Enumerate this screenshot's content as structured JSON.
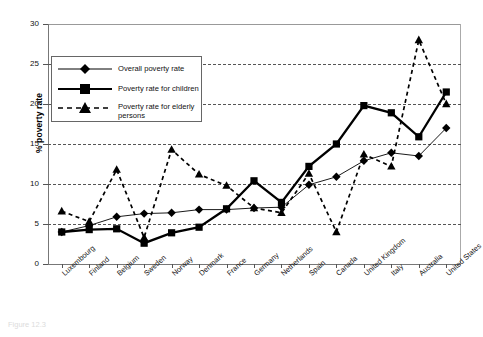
{
  "chart_data": {
    "type": "line",
    "title": "",
    "xlabel": "",
    "ylabel": "% poverty rate",
    "ylim": [
      0,
      30
    ],
    "yticks": [
      0,
      5,
      10,
      15,
      20,
      25,
      30
    ],
    "grid": true,
    "legend_position": "upper-left-inside",
    "categories": [
      "Luxembourg",
      "Finland",
      "Belgium",
      "Sweden",
      "Norway",
      "Denmark",
      "France",
      "Germany",
      "Netherlands",
      "Spain",
      "Canada",
      "United Kingdom",
      "Italy",
      "Australia",
      "United States"
    ],
    "series": [
      {
        "name": "Overall poverty rate",
        "marker": "diamond",
        "line": "solid",
        "values": [
          4.0,
          4.8,
          5.9,
          6.3,
          6.4,
          6.8,
          6.8,
          7.0,
          7.1,
          9.9,
          10.9,
          12.9,
          13.9,
          13.5,
          17.0
        ]
      },
      {
        "name": "Poverty rate for children",
        "marker": "square",
        "line": "solid-thick",
        "values": [
          4.0,
          4.3,
          4.4,
          2.6,
          3.9,
          4.6,
          6.9,
          10.4,
          7.7,
          12.2,
          15.0,
          19.8,
          18.9,
          15.9,
          21.5
        ]
      },
      {
        "name": "Poverty rate for elderly persons",
        "marker": "triangle",
        "line": "dashed",
        "values": [
          6.6,
          5.3,
          11.8,
          3.3,
          14.3,
          11.2,
          9.8,
          7.0,
          6.4,
          11.3,
          4.0,
          13.7,
          12.2,
          28.0,
          20.0
        ]
      }
    ]
  },
  "axis": {
    "y_label": "% poverty rate"
  },
  "legend": {
    "items": [
      {
        "label": "Overall poverty rate",
        "marker": "diamond-icon"
      },
      {
        "label": "Poverty rate for children",
        "marker": "square-icon"
      },
      {
        "label": "Poverty rate for elderly",
        "marker": "triangle-icon"
      },
      {
        "label": "persons",
        "marker": "none"
      }
    ]
  },
  "caption": {
    "text": "Figure 12.3"
  }
}
